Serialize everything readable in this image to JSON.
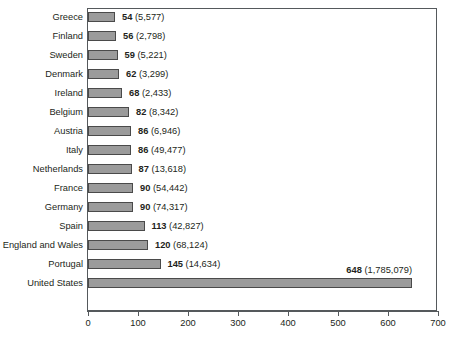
{
  "chart_data": {
    "type": "bar",
    "orientation": "horizontal",
    "title": "",
    "subtitle": "",
    "xlabel": "",
    "ylabel": "",
    "xlim": [
      0,
      700
    ],
    "xticks": [
      0,
      100,
      200,
      300,
      400,
      500,
      600,
      700
    ],
    "xtick_labels": [
      "0",
      "100",
      "200",
      "300",
      "400",
      "500",
      "600",
      "700"
    ],
    "grid": false,
    "legend": "none",
    "bar_color": "#9b9b9b",
    "bar_border_color": "#4a4a4a",
    "frame_color": "#55595c",
    "categories": [
      "Greece",
      "Finland",
      "Sweden",
      "Denmark",
      "Ireland",
      "Belgium",
      "Austria",
      "Italy",
      "Netherlands",
      "France",
      "Germany",
      "Spain",
      "England and Wales",
      "Portugal",
      "United States"
    ],
    "values": [
      54,
      56,
      59,
      62,
      68,
      82,
      86,
      86,
      87,
      90,
      90,
      113,
      120,
      145,
      648
    ],
    "counts": [
      "5,577",
      "2,798",
      "5,221",
      "3,299",
      "2,433",
      "8,342",
      "6,946",
      "49,477",
      "13,618",
      "54,442",
      "74,317",
      "42,827",
      "68,124",
      "14,634",
      "1,785,079"
    ],
    "point_labels": [
      "54 (5,577)",
      "56 (2,798)",
      "59 (5,221)",
      "62 (3,299)",
      "68 (2,433)",
      "82 (8,342)",
      "86 (6,946)",
      "86 (49,477)",
      "87 (13,618)",
      "90 (54,442)",
      "90 (74,317)",
      "113 (42,827)",
      "120 (68,124)",
      "145 (14,634)",
      "648 (1,785,079)"
    ]
  }
}
